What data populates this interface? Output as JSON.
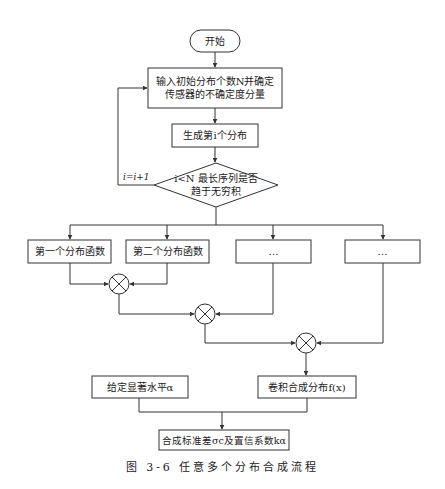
{
  "flowchart": {
    "start": {
      "label": "开始"
    },
    "input": {
      "line1": "输入初始分布个数N并确定",
      "line2": "传感器的不确定度分量"
    },
    "generate": {
      "label": "生成第i个分布"
    },
    "decision": {
      "line1": "i<N 最长序列是否",
      "line2": "趋于无穷积"
    },
    "loop_label": "i=i+1",
    "branches": [
      {
        "label": "第一个分布函数"
      },
      {
        "label": "第二个分布函数"
      },
      {
        "label": "…"
      },
      {
        "label": "…"
      }
    ],
    "convolution_nodes": [
      {
        "symbol": "⊗"
      },
      {
        "symbol": "⊗"
      },
      {
        "symbol": "⊗"
      }
    ],
    "significance": {
      "label": "给定显著水平α"
    },
    "convolution_result": {
      "label": "卷积合成分布f(x)"
    },
    "output": {
      "label": "合成标准差σc及置信系数kα"
    }
  },
  "caption": "图 3-6  任意多个分布合成流程",
  "colors": {
    "stroke": "#333333",
    "background": "#ffffff",
    "text": "#222222"
  }
}
